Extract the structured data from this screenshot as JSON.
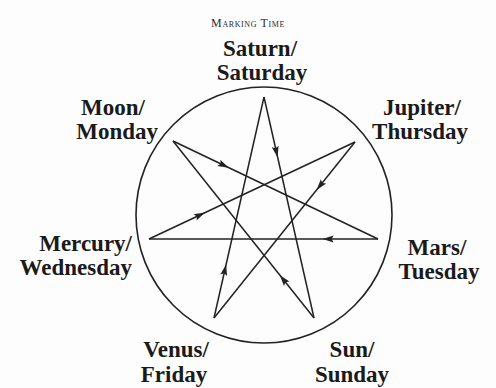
{
  "title": "Marking Time",
  "diagram": {
    "type": "heptagram-of-planetary-days",
    "circle": {
      "cx": 264,
      "cy": 215,
      "r": 128
    },
    "nodes": [
      {
        "id": "saturn",
        "planet": "Saturn/",
        "day": "Saturday",
        "vertex": [
          264,
          97
        ]
      },
      {
        "id": "jupiter",
        "planet": "Jupiter/",
        "day": "Thursday",
        "vertex": [
          355,
          142
        ]
      },
      {
        "id": "mars",
        "planet": "Mars/",
        "day": "Tuesday",
        "vertex": [
          378,
          239
        ]
      },
      {
        "id": "sun",
        "planet": "Sun/",
        "day": "Sunday",
        "vertex": [
          314,
          318
        ]
      },
      {
        "id": "venus",
        "planet": "Venus/",
        "day": "Friday",
        "vertex": [
          214,
          318
        ]
      },
      {
        "id": "mercury",
        "planet": "Mercury/",
        "day": "Wednesday",
        "vertex": [
          149,
          239
        ]
      },
      {
        "id": "moon",
        "planet": "Moon/",
        "day": "Monday",
        "vertex": [
          173,
          141
        ]
      }
    ],
    "edges": [
      {
        "from": "saturn",
        "to": "sun",
        "arrow_t": 0.25
      },
      {
        "from": "sun",
        "to": "moon",
        "arrow_t": 0.22
      },
      {
        "from": "moon",
        "to": "mars",
        "arrow_t": 0.25
      },
      {
        "from": "mars",
        "to": "mercury",
        "arrow_t": 0.22
      },
      {
        "from": "mercury",
        "to": "jupiter",
        "arrow_t": 0.25
      },
      {
        "from": "jupiter",
        "to": "venus",
        "arrow_t": 0.25
      },
      {
        "from": "venus",
        "to": "saturn",
        "arrow_t": 0.22
      }
    ],
    "sequence_note": "Saturday → Sunday → Monday → Tuesday → Wednesday → Thursday → Friday"
  },
  "colors": {
    "line": "#222222",
    "text": "#1a1a1a",
    "background": "#fdfdfd"
  }
}
